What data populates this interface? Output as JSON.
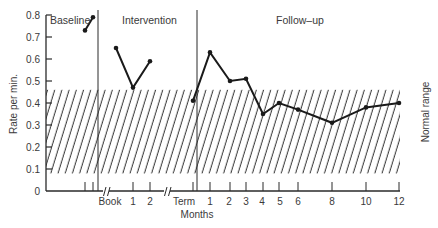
{
  "chart_data": {
    "type": "line",
    "title": "",
    "xlabel": "Months",
    "ylabel": "Rate per min.",
    "right_label": "Normal range",
    "ylim": [
      0,
      0.8
    ],
    "yticks": [
      "0",
      "0.1",
      "0.2",
      "0.3",
      "0.4",
      "0.5",
      "0.6",
      "0.7",
      "0.8"
    ],
    "normal_range": [
      0.08,
      0.46
    ],
    "phases": [
      {
        "name": "Baseline",
        "x": [
          0,
          1
        ],
        "values": [
          0.73,
          0.79
        ]
      },
      {
        "name": "Intervention",
        "x": [
          "Book",
          "1",
          "2"
        ],
        "values": [
          0.65,
          0.47,
          0.59
        ]
      },
      {
        "name": "Follow–up",
        "x": [
          "Term",
          "1",
          "2",
          "3",
          "4",
          "5",
          "6",
          "8",
          "10",
          "12"
        ],
        "values": [
          0.41,
          0.63,
          0.5,
          0.51,
          0.35,
          0.4,
          0.37,
          0.31,
          0.38,
          0.4
        ]
      }
    ],
    "xtick_labels": [
      "Book",
      "1",
      "2",
      "Term",
      "1",
      "2",
      "3",
      "4",
      "5",
      "6",
      "8",
      "10",
      "12"
    ],
    "grid": false,
    "legend": null
  },
  "labels": {
    "ylabel": "Rate per min.",
    "xlabel": "Months",
    "right": "Normal range",
    "phase_baseline": "Baseline",
    "phase_intervention": "Intervention",
    "phase_followup": "Follow–up"
  },
  "colors": {
    "line": "#1a1a1a",
    "hatch": "#2a2a2a",
    "axis": "#2a2a2a"
  }
}
